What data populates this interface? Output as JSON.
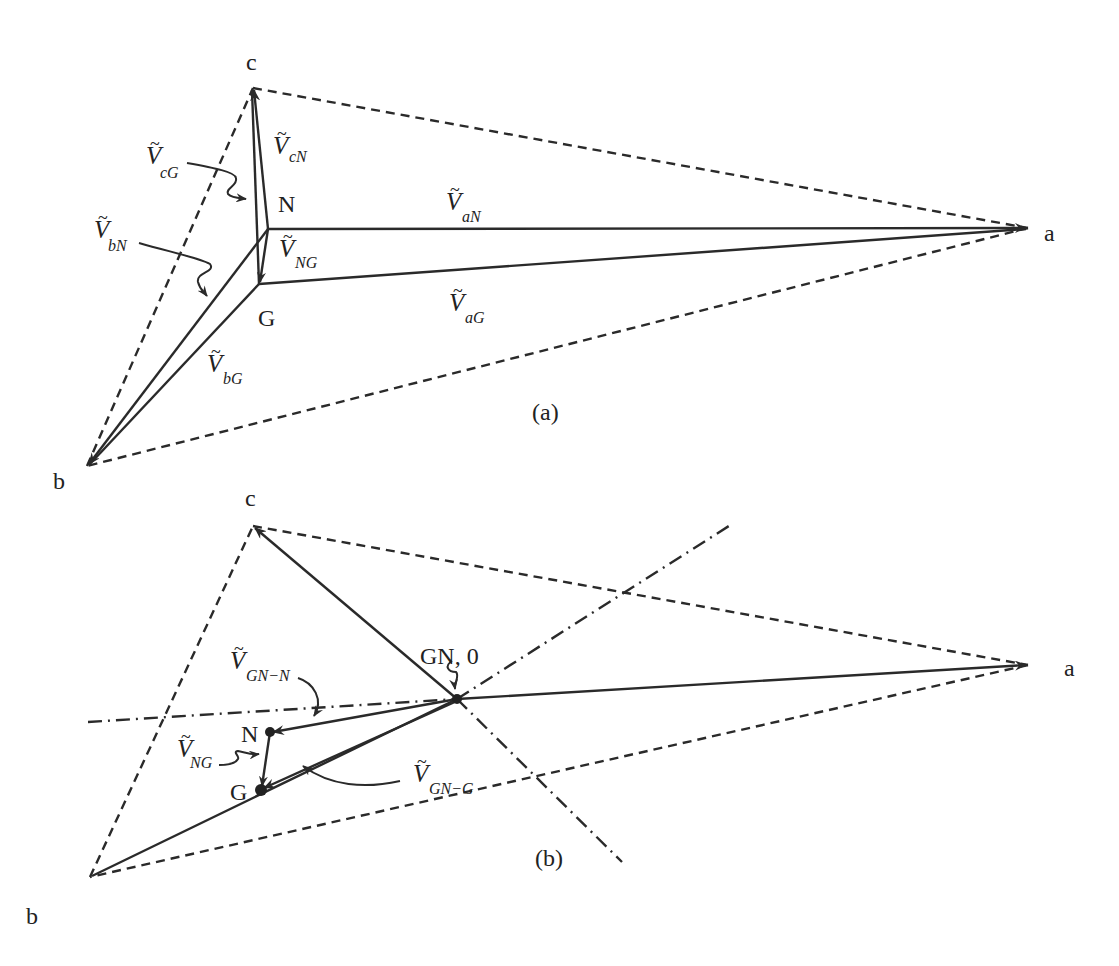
{
  "diagram_a": {
    "caption": "(a)",
    "points": {
      "a": {
        "label": "a",
        "x": 1028,
        "y": 228
      },
      "b": {
        "label": "b",
        "x": 87,
        "y": 466
      },
      "c": {
        "label": "c",
        "x": 253,
        "y": 88
      },
      "N": {
        "label": "N",
        "x": 268,
        "y": 229
      },
      "G": {
        "label": "G",
        "x": 259,
        "y": 284
      }
    },
    "phasors": [
      {
        "id": "VaN",
        "symbol": "V",
        "sub": "aN",
        "from": "N",
        "to": "a"
      },
      {
        "id": "VaG",
        "symbol": "V",
        "sub": "aG",
        "from": "G",
        "to": "a"
      },
      {
        "id": "VbN",
        "symbol": "V",
        "sub": "bN",
        "from": "N",
        "to": "b"
      },
      {
        "id": "VbG",
        "symbol": "V",
        "sub": "bG",
        "from": "G",
        "to": "b"
      },
      {
        "id": "VcN",
        "symbol": "V",
        "sub": "cN",
        "from": "N",
        "to": "c"
      },
      {
        "id": "VcG",
        "symbol": "V",
        "sub": "cG",
        "from": "G",
        "to": "c"
      },
      {
        "id": "VNG",
        "symbol": "V",
        "sub": "NG",
        "from": "N",
        "to": "G"
      }
    ],
    "line_triangle": [
      "a-b",
      "b-c",
      "c-a"
    ]
  },
  "diagram_b": {
    "caption": "(b)",
    "origin_label": "GN, 0",
    "points": {
      "a": {
        "label": "a",
        "x": 1028,
        "y": 665
      },
      "b": {
        "label": "b",
        "x": 90,
        "y": 877
      },
      "c": {
        "label": "c",
        "x": 253,
        "y": 526
      },
      "GN": {
        "label": "GN, 0",
        "x": 457,
        "y": 699
      },
      "N": {
        "label": "N",
        "x": 270,
        "y": 732
      },
      "G": {
        "label": "G",
        "x": 261,
        "y": 790
      }
    },
    "phasors": [
      {
        "id": "VGN-N",
        "symbol": "V",
        "sub": "GN−N",
        "from": "GN",
        "to": "N"
      },
      {
        "id": "VGN-G",
        "symbol": "V",
        "sub": "GN−G",
        "from": "GN",
        "to": "G"
      },
      {
        "id": "VNG",
        "symbol": "V",
        "sub": "NG",
        "from": "N",
        "to": "G"
      }
    ],
    "line_triangle": [
      "a-b",
      "b-c",
      "c-a"
    ],
    "reference_axes": [
      "dash-dot through GN horizontal-ish",
      "dash-dot through GN rising",
      "dash-dot through GN falling"
    ]
  },
  "labels": {
    "tilde": "~",
    "V": "V"
  }
}
